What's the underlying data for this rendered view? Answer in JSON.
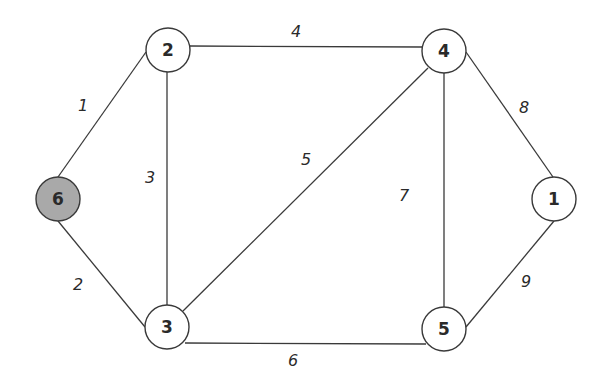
{
  "diagram": {
    "type": "weighted undirected graph",
    "colors": {
      "edge": "#3a3a3a",
      "node_fill": "#ffffff",
      "highlight_fill": "#a9a9a9",
      "text": "#2a2a2a"
    },
    "nodes": [
      {
        "id": "6",
        "label": "6",
        "x": 58,
        "y": 199,
        "highlighted": true
      },
      {
        "id": "2",
        "label": "2",
        "x": 168,
        "y": 50,
        "highlighted": false
      },
      {
        "id": "4",
        "label": "4",
        "x": 444,
        "y": 51,
        "highlighted": false
      },
      {
        "id": "1",
        "label": "1",
        "x": 554,
        "y": 199,
        "highlighted": false
      },
      {
        "id": "3",
        "label": "3",
        "x": 167,
        "y": 327,
        "highlighted": false
      },
      {
        "id": "5",
        "label": "5",
        "x": 444,
        "y": 329,
        "highlighted": false
      }
    ],
    "edges": [
      {
        "from": "6",
        "to": "2",
        "weight": "1",
        "label_x": 83,
        "label_y": 105
      },
      {
        "from": "6",
        "to": "3",
        "weight": "2",
        "label_x": 78,
        "label_y": 284
      },
      {
        "from": "2",
        "to": "3",
        "weight": "3",
        "label_x": 150,
        "label_y": 177
      },
      {
        "from": "2",
        "to": "4",
        "weight": "4",
        "label_x": 296,
        "label_y": 31
      },
      {
        "from": "3",
        "to": "4",
        "weight": "5",
        "label_x": 306,
        "label_y": 159
      },
      {
        "from": "3",
        "to": "5",
        "weight": "6",
        "label_x": 293,
        "label_y": 360
      },
      {
        "from": "4",
        "to": "5",
        "weight": "7",
        "label_x": 404,
        "label_y": 195
      },
      {
        "from": "4",
        "to": "1",
        "weight": "8",
        "label_x": 524,
        "label_y": 107
      },
      {
        "from": "5",
        "to": "1",
        "weight": "9",
        "label_x": 526,
        "label_y": 281
      }
    ]
  }
}
